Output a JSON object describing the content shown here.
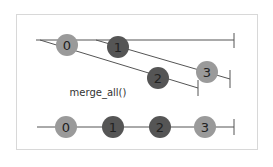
{
  "diagram": {
    "operator_label": "merge_all()",
    "colors": {
      "line": "#555555",
      "marble_light": "#9a9a9a",
      "marble_dark": "#555555",
      "frame": "#d8d8d8"
    },
    "outer_stream": {
      "marbles": [
        {
          "label": "0",
          "tone": "light"
        },
        {
          "label": "1",
          "tone": "dark"
        }
      ]
    },
    "inner_streams": [
      {
        "marbles": [
          {
            "label": "2",
            "tone": "dark"
          }
        ]
      },
      {
        "marbles": [
          {
            "label": "3",
            "tone": "light"
          }
        ]
      }
    ],
    "output_stream": {
      "marbles": [
        {
          "label": "0",
          "tone": "light"
        },
        {
          "label": "1",
          "tone": "dark"
        },
        {
          "label": "2",
          "tone": "dark"
        },
        {
          "label": "3",
          "tone": "light"
        }
      ]
    }
  }
}
